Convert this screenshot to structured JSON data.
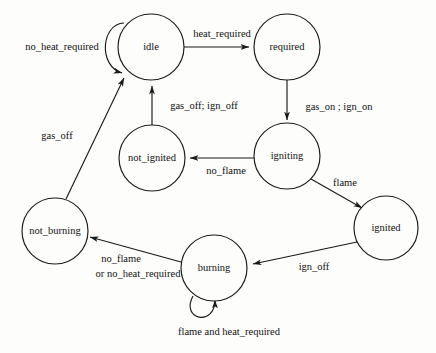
{
  "diagram": {
    "type": "state-machine",
    "title": "",
    "colors": {
      "background": "#fdfdfb",
      "stroke": "#1a1a1a",
      "text": "#111111"
    },
    "states": [
      {
        "id": "idle",
        "label": "idle",
        "cx": 151,
        "cy": 47,
        "r": 33
      },
      {
        "id": "required",
        "label": "required",
        "cx": 287,
        "cy": 47,
        "r": 33
      },
      {
        "id": "not_ignited",
        "label": "not_ignited",
        "cx": 152,
        "cy": 158,
        "r": 33
      },
      {
        "id": "igniting",
        "label": "igniting",
        "cx": 287,
        "cy": 156,
        "r": 33
      },
      {
        "id": "ignited",
        "label": "ignited",
        "cx": 386,
        "cy": 228,
        "r": 32
      },
      {
        "id": "not_burning",
        "label": "not_burning",
        "cx": 55,
        "cy": 231,
        "r": 33
      },
      {
        "id": "burning",
        "label": "burning",
        "cx": 214,
        "cy": 268,
        "r": 33
      }
    ],
    "transitions": [
      {
        "id": "idle-self",
        "from": "idle",
        "to": "idle",
        "label": "no_heat_required",
        "label_x": 62,
        "label_y": 48
      },
      {
        "id": "idle-to-required",
        "from": "idle",
        "to": "required",
        "label": "heat_required",
        "label_x": 222,
        "label_y": 35
      },
      {
        "id": "required-to-igniting",
        "from": "required",
        "to": "igniting",
        "label": "gas_on ; ign_on",
        "label_x": 339,
        "label_y": 108
      },
      {
        "id": "igniting-to-not-ignited",
        "from": "igniting",
        "to": "not_ignited",
        "label": "no_flame",
        "label_x": 226,
        "label_y": 172
      },
      {
        "id": "not-ignited-to-idle",
        "from": "not_ignited",
        "to": "idle",
        "label": "gas_off; ign_off",
        "label_x": 204,
        "label_y": 107
      },
      {
        "id": "igniting-to-ignited",
        "from": "igniting",
        "to": "ignited",
        "label": "flame",
        "label_x": 345,
        "label_y": 184
      },
      {
        "id": "ignited-to-burning",
        "from": "ignited",
        "to": "burning",
        "label": "ign_off",
        "label_x": 314,
        "label_y": 268
      },
      {
        "id": "burning-self",
        "from": "burning",
        "to": "burning",
        "label": "flame and heat_required",
        "label_x": 229,
        "label_y": 333
      },
      {
        "id": "burning-to-not-burning",
        "from": "burning",
        "to": "not_burning",
        "label": "no_flame",
        "label_x": 121,
        "label_y": 260,
        "label2": "or no_heat_required",
        "label2_x": 138,
        "label2_y": 275
      },
      {
        "id": "not-burning-to-idle",
        "from": "not_burning",
        "to": "idle",
        "label": "gas_off",
        "label_x": 57,
        "label_y": 137
      }
    ]
  }
}
